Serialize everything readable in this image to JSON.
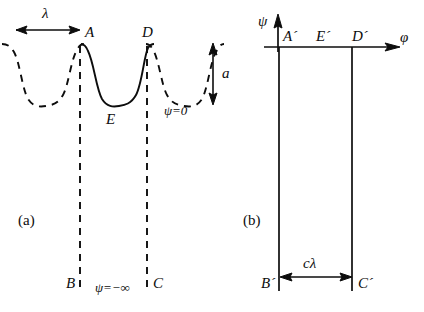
{
  "figure": {
    "background": "#ffffff",
    "stroke_color": "#0d0d0d",
    "width": 424,
    "height": 312
  },
  "panel_a": {
    "tag": "(a)",
    "description": "Physical plane: periodic wavy streamline with one solid period between A and D",
    "labels": {
      "wavelength": "λ",
      "amplitude": "a",
      "crest_left": "A",
      "crest_right": "D",
      "trough": "E",
      "bottom_left": "B",
      "bottom_right": "C",
      "surface_condition": "ψ=0",
      "bottom_condition": "ψ=−∞"
    }
  },
  "panel_b": {
    "tag": "(b)",
    "description": "Potential plane: semi-infinite strip bounded by the images of A, D, B, C",
    "labels": {
      "axis_vertical": "ψ",
      "axis_horizontal": "φ",
      "crest_left": "A´",
      "midpoint": "E´",
      "crest_right": "D´",
      "bottom_left": "B´",
      "bottom_right": "C´",
      "width_label": "cλ"
    }
  }
}
